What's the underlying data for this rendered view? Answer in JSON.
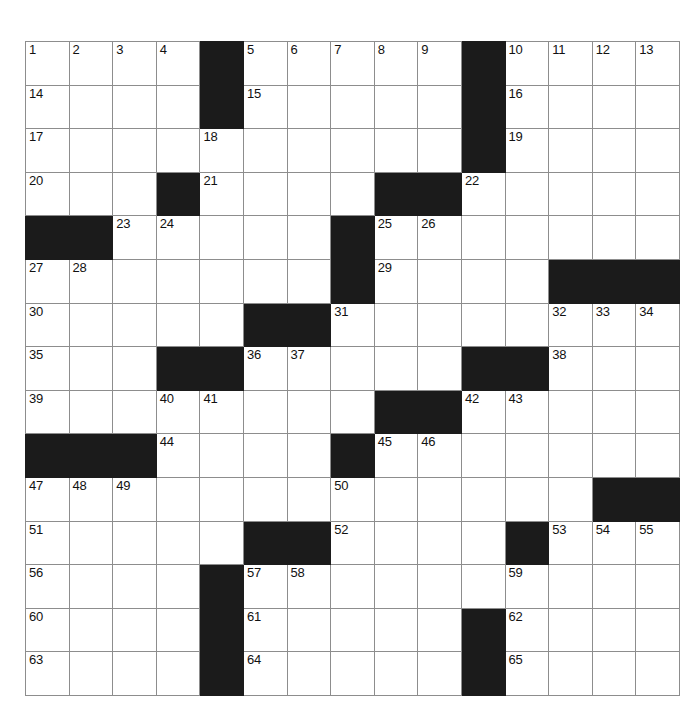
{
  "puzzle": {
    "title": "Crossword Grid",
    "rows": 15,
    "cols": 15,
    "colors": {
      "block": "#1b1b1b",
      "cell": "#ffffff",
      "grid_line": "#8d8d8d",
      "outer_border": "#3a3a3a",
      "number_text": "#111111"
    },
    "grid": [
      [
        {
          "type": "open",
          "number": "1"
        },
        {
          "type": "open",
          "number": "2"
        },
        {
          "type": "open",
          "number": "3"
        },
        {
          "type": "open",
          "number": "4"
        },
        {
          "type": "block",
          "number": ""
        },
        {
          "type": "open",
          "number": "5"
        },
        {
          "type": "open",
          "number": "6"
        },
        {
          "type": "open",
          "number": "7"
        },
        {
          "type": "open",
          "number": "8"
        },
        {
          "type": "open",
          "number": "9"
        },
        {
          "type": "block",
          "number": ""
        },
        {
          "type": "open",
          "number": "10"
        },
        {
          "type": "open",
          "number": "11"
        },
        {
          "type": "open",
          "number": "12"
        },
        {
          "type": "open",
          "number": "13"
        }
      ],
      [
        {
          "type": "open",
          "number": "14"
        },
        {
          "type": "open",
          "number": ""
        },
        {
          "type": "open",
          "number": ""
        },
        {
          "type": "open",
          "number": ""
        },
        {
          "type": "block",
          "number": ""
        },
        {
          "type": "open",
          "number": "15"
        },
        {
          "type": "open",
          "number": ""
        },
        {
          "type": "open",
          "number": ""
        },
        {
          "type": "open",
          "number": ""
        },
        {
          "type": "open",
          "number": ""
        },
        {
          "type": "block",
          "number": ""
        },
        {
          "type": "open",
          "number": "16"
        },
        {
          "type": "open",
          "number": ""
        },
        {
          "type": "open",
          "number": ""
        },
        {
          "type": "open",
          "number": ""
        }
      ],
      [
        {
          "type": "open",
          "number": "17"
        },
        {
          "type": "open",
          "number": ""
        },
        {
          "type": "open",
          "number": ""
        },
        {
          "type": "open",
          "number": ""
        },
        {
          "type": "open",
          "number": "18"
        },
        {
          "type": "open",
          "number": ""
        },
        {
          "type": "open",
          "number": ""
        },
        {
          "type": "open",
          "number": ""
        },
        {
          "type": "open",
          "number": ""
        },
        {
          "type": "open",
          "number": ""
        },
        {
          "type": "block",
          "number": ""
        },
        {
          "type": "open",
          "number": "19"
        },
        {
          "type": "open",
          "number": ""
        },
        {
          "type": "open",
          "number": ""
        },
        {
          "type": "open",
          "number": ""
        }
      ],
      [
        {
          "type": "open",
          "number": "20"
        },
        {
          "type": "open",
          "number": ""
        },
        {
          "type": "open",
          "number": ""
        },
        {
          "type": "block",
          "number": ""
        },
        {
          "type": "open",
          "number": "21"
        },
        {
          "type": "open",
          "number": ""
        },
        {
          "type": "open",
          "number": ""
        },
        {
          "type": "open",
          "number": ""
        },
        {
          "type": "block",
          "number": ""
        },
        {
          "type": "block",
          "number": ""
        },
        {
          "type": "open",
          "number": "22"
        },
        {
          "type": "open",
          "number": ""
        },
        {
          "type": "open",
          "number": ""
        },
        {
          "type": "open",
          "number": ""
        },
        {
          "type": "open",
          "number": ""
        }
      ],
      [
        {
          "type": "block",
          "number": ""
        },
        {
          "type": "block",
          "number": ""
        },
        {
          "type": "open",
          "number": "23"
        },
        {
          "type": "open",
          "number": "24"
        },
        {
          "type": "open",
          "number": ""
        },
        {
          "type": "open",
          "number": ""
        },
        {
          "type": "open",
          "number": ""
        },
        {
          "type": "block",
          "number": ""
        },
        {
          "type": "open",
          "number": "25"
        },
        {
          "type": "open",
          "number": "26"
        },
        {
          "type": "open",
          "number": ""
        },
        {
          "type": "open",
          "number": ""
        },
        {
          "type": "open",
          "number": ""
        },
        {
          "type": "open",
          "number": ""
        },
        {
          "type": "open",
          "number": ""
        }
      ],
      [
        {
          "type": "open",
          "number": "27"
        },
        {
          "type": "open",
          "number": "28"
        },
        {
          "type": "open",
          "number": ""
        },
        {
          "type": "open",
          "number": ""
        },
        {
          "type": "open",
          "number": ""
        },
        {
          "type": "open",
          "number": ""
        },
        {
          "type": "open",
          "number": ""
        },
        {
          "type": "block",
          "number": ""
        },
        {
          "type": "open",
          "number": "29"
        },
        {
          "type": "open",
          "number": ""
        },
        {
          "type": "open",
          "number": ""
        },
        {
          "type": "open",
          "number": ""
        },
        {
          "type": "block",
          "number": ""
        },
        {
          "type": "block",
          "number": ""
        },
        {
          "type": "block",
          "number": ""
        }
      ],
      [
        {
          "type": "open",
          "number": "30"
        },
        {
          "type": "open",
          "number": ""
        },
        {
          "type": "open",
          "number": ""
        },
        {
          "type": "open",
          "number": ""
        },
        {
          "type": "open",
          "number": ""
        },
        {
          "type": "block",
          "number": ""
        },
        {
          "type": "block",
          "number": ""
        },
        {
          "type": "open",
          "number": "31"
        },
        {
          "type": "open",
          "number": ""
        },
        {
          "type": "open",
          "number": ""
        },
        {
          "type": "open",
          "number": ""
        },
        {
          "type": "open",
          "number": ""
        },
        {
          "type": "open",
          "number": "32"
        },
        {
          "type": "open",
          "number": "33"
        },
        {
          "type": "open",
          "number": "34"
        }
      ],
      [
        {
          "type": "open",
          "number": "35"
        },
        {
          "type": "open",
          "number": ""
        },
        {
          "type": "open",
          "number": ""
        },
        {
          "type": "block",
          "number": ""
        },
        {
          "type": "block",
          "number": ""
        },
        {
          "type": "open",
          "number": "36"
        },
        {
          "type": "open",
          "number": "37"
        },
        {
          "type": "open",
          "number": ""
        },
        {
          "type": "open",
          "number": ""
        },
        {
          "type": "open",
          "number": ""
        },
        {
          "type": "block",
          "number": ""
        },
        {
          "type": "block",
          "number": ""
        },
        {
          "type": "open",
          "number": "38"
        },
        {
          "type": "open",
          "number": ""
        },
        {
          "type": "open",
          "number": ""
        }
      ],
      [
        {
          "type": "open",
          "number": "39"
        },
        {
          "type": "open",
          "number": ""
        },
        {
          "type": "open",
          "number": ""
        },
        {
          "type": "open",
          "number": "40"
        },
        {
          "type": "open",
          "number": "41"
        },
        {
          "type": "open",
          "number": ""
        },
        {
          "type": "open",
          "number": ""
        },
        {
          "type": "open",
          "number": ""
        },
        {
          "type": "block",
          "number": ""
        },
        {
          "type": "block",
          "number": ""
        },
        {
          "type": "open",
          "number": "42"
        },
        {
          "type": "open",
          "number": "43"
        },
        {
          "type": "open",
          "number": ""
        },
        {
          "type": "open",
          "number": ""
        },
        {
          "type": "open",
          "number": ""
        }
      ],
      [
        {
          "type": "block",
          "number": ""
        },
        {
          "type": "block",
          "number": ""
        },
        {
          "type": "block",
          "number": ""
        },
        {
          "type": "open",
          "number": "44"
        },
        {
          "type": "open",
          "number": ""
        },
        {
          "type": "open",
          "number": ""
        },
        {
          "type": "open",
          "number": ""
        },
        {
          "type": "block",
          "number": ""
        },
        {
          "type": "open",
          "number": "45"
        },
        {
          "type": "open",
          "number": "46"
        },
        {
          "type": "open",
          "number": ""
        },
        {
          "type": "open",
          "number": ""
        },
        {
          "type": "open",
          "number": ""
        },
        {
          "type": "open",
          "number": ""
        },
        {
          "type": "open",
          "number": ""
        }
      ],
      [
        {
          "type": "open",
          "number": "47"
        },
        {
          "type": "open",
          "number": "48"
        },
        {
          "type": "open",
          "number": "49"
        },
        {
          "type": "open",
          "number": ""
        },
        {
          "type": "open",
          "number": ""
        },
        {
          "type": "open",
          "number": ""
        },
        {
          "type": "open",
          "number": ""
        },
        {
          "type": "open",
          "number": "50"
        },
        {
          "type": "open",
          "number": ""
        },
        {
          "type": "open",
          "number": ""
        },
        {
          "type": "open",
          "number": ""
        },
        {
          "type": "open",
          "number": ""
        },
        {
          "type": "open",
          "number": ""
        },
        {
          "type": "block",
          "number": ""
        },
        {
          "type": "block",
          "number": ""
        }
      ],
      [
        {
          "type": "open",
          "number": "51"
        },
        {
          "type": "open",
          "number": ""
        },
        {
          "type": "open",
          "number": ""
        },
        {
          "type": "open",
          "number": ""
        },
        {
          "type": "open",
          "number": ""
        },
        {
          "type": "block",
          "number": ""
        },
        {
          "type": "block",
          "number": ""
        },
        {
          "type": "open",
          "number": "52"
        },
        {
          "type": "open",
          "number": ""
        },
        {
          "type": "open",
          "number": ""
        },
        {
          "type": "open",
          "number": ""
        },
        {
          "type": "block",
          "number": ""
        },
        {
          "type": "open",
          "number": "53"
        },
        {
          "type": "open",
          "number": "54"
        },
        {
          "type": "open",
          "number": "55"
        }
      ],
      [
        {
          "type": "open",
          "number": "56"
        },
        {
          "type": "open",
          "number": ""
        },
        {
          "type": "open",
          "number": ""
        },
        {
          "type": "open",
          "number": ""
        },
        {
          "type": "block",
          "number": ""
        },
        {
          "type": "open",
          "number": "57"
        },
        {
          "type": "open",
          "number": "58"
        },
        {
          "type": "open",
          "number": ""
        },
        {
          "type": "open",
          "number": ""
        },
        {
          "type": "open",
          "number": ""
        },
        {
          "type": "open",
          "number": ""
        },
        {
          "type": "open",
          "number": "59"
        },
        {
          "type": "open",
          "number": ""
        },
        {
          "type": "open",
          "number": ""
        },
        {
          "type": "open",
          "number": ""
        }
      ],
      [
        {
          "type": "open",
          "number": "60"
        },
        {
          "type": "open",
          "number": ""
        },
        {
          "type": "open",
          "number": ""
        },
        {
          "type": "open",
          "number": ""
        },
        {
          "type": "block",
          "number": ""
        },
        {
          "type": "open",
          "number": "61"
        },
        {
          "type": "open",
          "number": ""
        },
        {
          "type": "open",
          "number": ""
        },
        {
          "type": "open",
          "number": ""
        },
        {
          "type": "open",
          "number": ""
        },
        {
          "type": "block",
          "number": ""
        },
        {
          "type": "open",
          "number": "62"
        },
        {
          "type": "open",
          "number": ""
        },
        {
          "type": "open",
          "number": ""
        },
        {
          "type": "open",
          "number": ""
        }
      ],
      [
        {
          "type": "open",
          "number": "63"
        },
        {
          "type": "open",
          "number": ""
        },
        {
          "type": "open",
          "number": ""
        },
        {
          "type": "open",
          "number": ""
        },
        {
          "type": "block",
          "number": ""
        },
        {
          "type": "open",
          "number": "64"
        },
        {
          "type": "open",
          "number": ""
        },
        {
          "type": "open",
          "number": ""
        },
        {
          "type": "open",
          "number": ""
        },
        {
          "type": "open",
          "number": ""
        },
        {
          "type": "block",
          "number": ""
        },
        {
          "type": "open",
          "number": "65"
        },
        {
          "type": "open",
          "number": ""
        },
        {
          "type": "open",
          "number": ""
        },
        {
          "type": "open",
          "number": ""
        }
      ]
    ]
  }
}
